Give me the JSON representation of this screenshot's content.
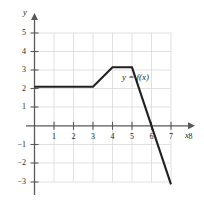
{
  "chart_data": {
    "type": "line",
    "title": "",
    "subtitle": "",
    "xlabel": "x",
    "ylabel": "y",
    "xlim": [
      0,
      8
    ],
    "ylim": [
      -3,
      5
    ],
    "grid": true,
    "grid_color": "#d8d8d8",
    "axis_color": "#58595b",
    "curve_color": "#231f20",
    "legend_position": "inline-annotation",
    "annotations": [
      {
        "text": "y = f(x)",
        "x": 5.6,
        "y": 2.45
      }
    ],
    "xticks": [
      1,
      2,
      3,
      4,
      5,
      6,
      7,
      8
    ],
    "xtick_labels": [
      "1",
      "2",
      "3",
      "4",
      "5",
      "6",
      "7",
      "8"
    ],
    "yticks": [
      5,
      4,
      3,
      2,
      1,
      -1,
      -2,
      -3
    ],
    "ytick_labels": [
      "5",
      "4",
      "3",
      "2",
      "1",
      "−1",
      "−2",
      "−3"
    ],
    "series": [
      {
        "name": "f(x)",
        "points": [
          {
            "x": 0,
            "y": 2
          },
          {
            "x": 3,
            "y": 2
          },
          {
            "x": 4,
            "y": 3
          },
          {
            "x": 5,
            "y": 3
          },
          {
            "x": 7,
            "y": -3
          }
        ],
        "x_intercept": 6
      }
    ]
  },
  "axes": {
    "y_axis_label": "y",
    "x_axis_label": "x"
  },
  "curve": {
    "label": "y = f(x)"
  },
  "ticks": {
    "y": {
      "t5": "5",
      "t4": "4",
      "t3": "3",
      "t2": "2",
      "t1": "1",
      "tm1": "−1",
      "tm2": "−2",
      "tm3": "−3"
    },
    "x": {
      "t1": "1",
      "t2": "2",
      "t3": "3",
      "t4": "4",
      "t5": "5",
      "t6": "6",
      "t7": "7",
      "t8": "8"
    }
  }
}
